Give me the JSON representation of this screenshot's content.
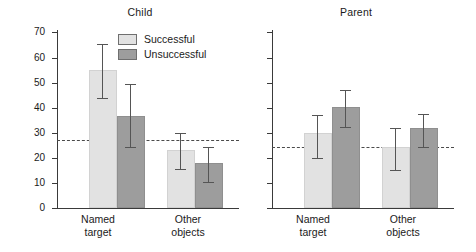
{
  "chart_data": {
    "type": "bar",
    "title": "",
    "ylabel": "Mean percentage of frames",
    "xlabel": "",
    "ylim": [
      0,
      70
    ],
    "yticks": [
      0,
      10,
      20,
      30,
      40,
      50,
      60,
      70
    ],
    "grid": false,
    "legend_position": "top-center-inside",
    "categories": [
      "Named target",
      "Other objects"
    ],
    "panels": [
      {
        "name": "Child",
        "reference_line": 27,
        "series": [
          {
            "name": "Successful",
            "color": "#e2e2e2",
            "values": [
              54,
              22.5
            ],
            "err_low": [
              44,
              15.5
            ],
            "err_high": [
              65.5,
              30
            ]
          },
          {
            "name": "Unsuccessful",
            "color": "#9d9d9d",
            "values": [
              36,
              17
            ],
            "err_low": [
              24.5,
              10.5
            ],
            "err_high": [
              49.5,
              24.5
            ]
          }
        ]
      },
      {
        "name": "Parent",
        "reference_line": 24.5,
        "series": [
          {
            "name": "Successful",
            "color": "#e2e2e2",
            "values": [
              29,
              23.5
            ],
            "err_low": [
              20,
              15
            ],
            "err_high": [
              37,
              32
            ]
          },
          {
            "name": "Unsuccessful",
            "color": "#9d9d9d",
            "values": [
              39.5,
              31
            ],
            "err_low": [
              32.5,
              24.5
            ],
            "err_high": [
              47,
              37.5
            ]
          }
        ]
      }
    ],
    "annotations": [
      "Dashed horizontal reference line in each panel"
    ]
  },
  "axis": {
    "tick_70": "70",
    "tick_60": "60",
    "tick_50": "50",
    "tick_40": "40",
    "tick_30": "30",
    "tick_20": "20",
    "tick_10": "10",
    "tick_0": "0",
    "ylabel": "Mean percentage of frames"
  },
  "panel_child": {
    "title": "Child",
    "cat1_line1": "Named",
    "cat1_line2": "target",
    "cat2_line1": "Other",
    "cat2_line2": "objects"
  },
  "panel_parent": {
    "title": "Parent",
    "cat1_line1": "Named",
    "cat1_line2": "target",
    "cat2_line1": "Other",
    "cat2_line2": "objects"
  },
  "legend": {
    "item1": "Successful",
    "item2": "Unsuccessful"
  }
}
